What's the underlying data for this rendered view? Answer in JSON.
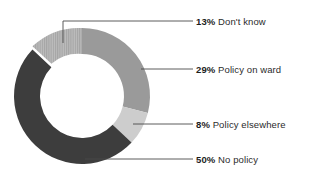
{
  "chart_data": {
    "type": "pie",
    "variant": "donut",
    "title": "",
    "subtitle": "",
    "xlabel": "",
    "ylabel": "",
    "grid": false,
    "legend_position": "right-callouts",
    "value_unit": "%",
    "total": 100,
    "start_angle_deg": 0,
    "direction": "clockwise",
    "categories": [
      "Policy on ward",
      "Policy elsewhere",
      "No policy",
      "Don't know"
    ],
    "values": [
      29,
      8,
      50,
      13
    ],
    "slices": [
      {
        "label": "Policy on ward",
        "value": 29,
        "value_label": "29%",
        "color": "#9a9a9a",
        "pattern": "solid",
        "start_deg": 0,
        "end_deg": 104.4,
        "callout_label": "29% Policy on ward"
      },
      {
        "label": "Policy elsewhere",
        "value": 8,
        "value_label": "8%",
        "color": "#cdcdcd",
        "pattern": "solid",
        "start_deg": 104.4,
        "end_deg": 133.2,
        "callout_label": "8% Policy elsewhere"
      },
      {
        "label": "No policy",
        "value": 50,
        "value_label": "50%",
        "color": "#3d3d3d",
        "pattern": "solid",
        "start_deg": 133.2,
        "end_deg": 313.2,
        "callout_label": "50% No policy"
      },
      {
        "label": "Don't know",
        "value": 13,
        "value_label": "13%",
        "color": "#b4b4b4",
        "pattern": "vertical-stripes",
        "start_deg": 313.2,
        "end_deg": 360,
        "callout_label": "13% Don't know"
      }
    ]
  },
  "labels": {
    "dont_know": {
      "pct": "13%",
      "text": "Don't know"
    },
    "policy_on_ward": {
      "pct": "29%",
      "text": "Policy on ward"
    },
    "policy_elsewhere": {
      "pct": "8%",
      "text": "Policy elsewhere"
    },
    "no_policy": {
      "pct": "50%",
      "text": "No policy"
    }
  },
  "colors": {
    "background": "#ffffff",
    "policy_on_ward": "#9a9a9a",
    "policy_elsewhere": "#cdcdcd",
    "no_policy": "#3d3d3d",
    "dont_know": "#b4b4b4",
    "leader_line": "#4a4a4a",
    "text": "#2b2b2b",
    "hole": "#ffffff"
  },
  "geometry": {
    "center_x": 82,
    "center_y": 96,
    "outer_radius": 68,
    "inner_radius": 42
  }
}
